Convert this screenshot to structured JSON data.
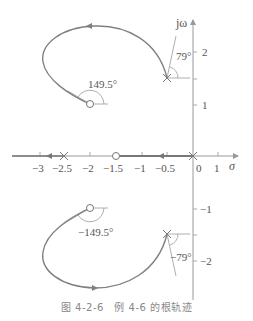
{
  "figure": {
    "caption": "图 4-2-6　例 4-6 的根轨迹",
    "axes": {
      "x_label": "σ",
      "y_label": "jω",
      "x_ticks": [
        {
          "value": -3,
          "label": "−3"
        },
        {
          "value": -2.5,
          "label": "−2.5"
        },
        {
          "value": -2,
          "label": "−2"
        },
        {
          "value": -1.5,
          "label": "−1.5"
        },
        {
          "value": -1,
          "label": "−1"
        },
        {
          "value": -0.5,
          "label": "−0.5"
        },
        {
          "value": 0,
          "label": "0"
        },
        {
          "value": 1,
          "label": "1"
        }
      ],
      "y_ticks": [
        {
          "value": 2,
          "label": "2"
        },
        {
          "value": 1,
          "label": "1"
        },
        {
          "value": -1,
          "label": "−1"
        },
        {
          "value": -2,
          "label": "−2"
        }
      ]
    },
    "annotations": {
      "upper_departure_angle": "79°",
      "upper_arrival_angle": "149.5°",
      "lower_arrival_angle": "−149.5°",
      "lower_departure_angle": "−79°"
    },
    "poles": [
      {
        "re": 0,
        "im": 0
      },
      {
        "re": -2.5,
        "im": 0
      },
      {
        "re": -0.5,
        "im": 1.5
      },
      {
        "re": -0.5,
        "im": -1.5
      }
    ],
    "zeros": [
      {
        "re": -1.5,
        "im": 0
      },
      {
        "re": -2,
        "im": 1
      },
      {
        "re": -2,
        "im": -1
      }
    ],
    "colors": {
      "locus": "#808080",
      "axis": "#9a9a9a",
      "text": "#555555"
    }
  }
}
